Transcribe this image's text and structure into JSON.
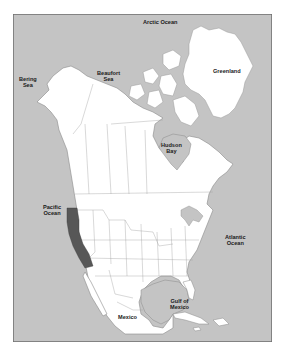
{
  "map": {
    "title": "North America",
    "highlighted_region": "California / Baja coastal strip",
    "colors": {
      "water": "#c4c4c4",
      "land": "#ffffff",
      "border": "#8a8a8a",
      "highlight": "#575757",
      "frame": "#6e6e6e"
    },
    "labels": {
      "arctic_ocean": "Arctic Ocean",
      "greenland": "Greenland",
      "bering_sea_1": "Bering",
      "bering_sea_2": "Sea",
      "beaufort_sea_1": "Beaufort",
      "beaufort_sea_2": "Sea",
      "hudson_bay_1": "Hudson",
      "hudson_bay_2": "Bay",
      "pacific_ocean_1": "Pacific",
      "pacific_ocean_2": "Ocean",
      "atlantic_ocean_1": "Atlantic",
      "atlantic_ocean_2": "Ocean",
      "gulf_of_mexico_1": "Gulf of",
      "gulf_of_mexico_2": "Mexico",
      "mexico": "Mexico"
    }
  }
}
